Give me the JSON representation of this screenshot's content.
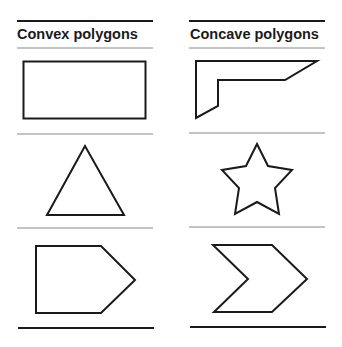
{
  "columns": [
    {
      "title": "Convex polygons",
      "shapes": [
        "rectangle",
        "triangle",
        "pentagon"
      ]
    },
    {
      "title": "Concave polygons",
      "shapes": [
        "l-shaped-polygon",
        "star",
        "chevron"
      ]
    }
  ],
  "colors": {
    "stroke": "#1a1a1a",
    "rule_thin": "#888888",
    "background": "#ffffff"
  }
}
